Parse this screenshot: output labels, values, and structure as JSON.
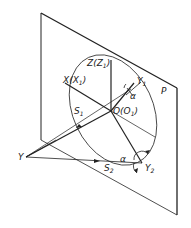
{
  "diagram": {
    "plane_label": "P",
    "labels": {
      "z": "Z(Z",
      "z_sub": "1",
      "x": "X(X",
      "x_sub": "1",
      "o": "O(O",
      "o_sub": "1",
      "y1": "Y",
      "y1_sub": "1",
      "y2": "Y",
      "y2_sub": "2",
      "y": "Y",
      "s1": "S",
      "s1_sub": "1",
      "s2": "S",
      "s2_sub": "2",
      "alpha_top": "α",
      "alpha_bottom": "α",
      "close_paren": ")"
    },
    "colors": {
      "line": "#222222",
      "background": "#ffffff"
    }
  }
}
